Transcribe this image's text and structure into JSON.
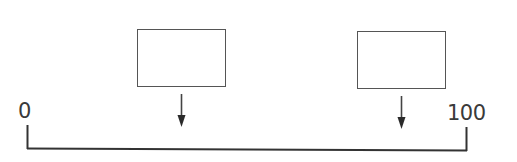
{
  "diagram": {
    "type": "number-line",
    "number_line": {
      "start_label": "0",
      "end_label": "100",
      "min": 0,
      "max": 100
    },
    "boxes": [
      {
        "id": "box-1",
        "content": "",
        "points_to": "position on number line (left of middle)"
      },
      {
        "id": "box-2",
        "content": "",
        "points_to": "position on number line (near right end)"
      }
    ],
    "arrows": [
      {
        "from": "box-1",
        "direction": "down"
      },
      {
        "from": "box-2",
        "direction": "down"
      }
    ],
    "colors": {
      "line": "#333333",
      "box_border": "#555555",
      "text": "#3a3a3a",
      "background": "#ffffff"
    }
  }
}
